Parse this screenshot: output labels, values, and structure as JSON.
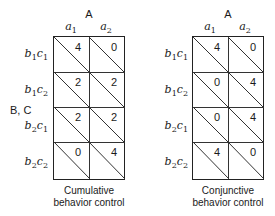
{
  "axis": {
    "column_factor": "A",
    "row_factor": "B, C"
  },
  "panels": [
    {
      "caption_line1": "Cumulative",
      "caption_line2": "behavior control",
      "columns": [
        {
          "base": "a",
          "sub": "1"
        },
        {
          "base": "a",
          "sub": "2"
        }
      ],
      "rows": [
        {
          "b": "1",
          "c": "1",
          "values": [
            "4",
            "0"
          ]
        },
        {
          "b": "1",
          "c": "2",
          "values": [
            "2",
            "2"
          ]
        },
        {
          "b": "2",
          "c": "1",
          "values": [
            "2",
            "2"
          ]
        },
        {
          "b": "2",
          "c": "2",
          "values": [
            "0",
            "4"
          ]
        }
      ]
    },
    {
      "caption_line1": "Conjunctive",
      "caption_line2": "behavior control",
      "columns": [
        {
          "base": "a",
          "sub": "1"
        },
        {
          "base": "a",
          "sub": "2"
        }
      ],
      "rows": [
        {
          "b": "1",
          "c": "1",
          "values": [
            "4",
            "0"
          ]
        },
        {
          "b": "1",
          "c": "2",
          "values": [
            "0",
            "4"
          ]
        },
        {
          "b": "2",
          "c": "1",
          "values": [
            "0",
            "4"
          ]
        },
        {
          "b": "2",
          "c": "2",
          "values": [
            "4",
            "0"
          ]
        }
      ]
    }
  ]
}
